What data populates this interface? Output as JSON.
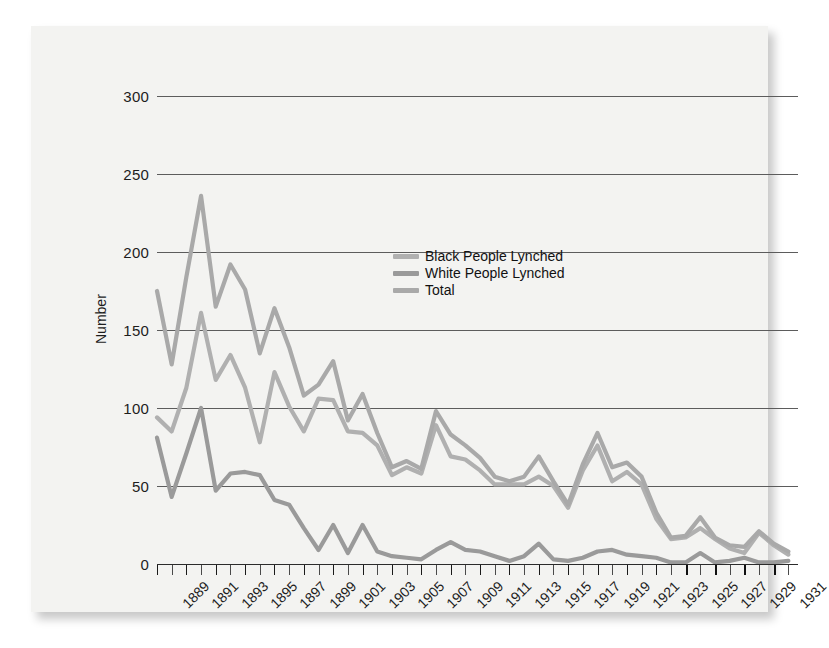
{
  "chart_data": {
    "type": "line",
    "title": "",
    "xlabel": "",
    "ylabel": "Number",
    "ylim": [
      0,
      300
    ],
    "yticks": [
      0,
      50,
      100,
      150,
      200,
      250,
      300
    ],
    "grid": true,
    "legend_position": "inside-upper-right",
    "x": [
      1889,
      1890,
      1891,
      1892,
      1893,
      1894,
      1895,
      1896,
      1897,
      1898,
      1899,
      1900,
      1901,
      1902,
      1903,
      1904,
      1905,
      1906,
      1907,
      1908,
      1909,
      1910,
      1911,
      1912,
      1913,
      1914,
      1915,
      1916,
      1917,
      1918,
      1919,
      1920,
      1921,
      1922,
      1923,
      1924,
      1925,
      1926,
      1927,
      1928,
      1929,
      1930,
      1931,
      1932
    ],
    "xtick_labels": [
      "1889",
      "1891",
      "1893",
      "1895",
      "1897",
      "1899",
      "1901",
      "1903",
      "1905",
      "1907",
      "1909",
      "1911",
      "1913",
      "1915",
      "1917",
      "1919",
      "1921",
      "1923",
      "1925",
      "1927",
      "1929",
      "1931"
    ],
    "series": [
      {
        "name": "Black People Lynched",
        "color": "#b0b0b0",
        "values": [
          94,
          85,
          113,
          161,
          118,
          134,
          113,
          78,
          123,
          101,
          85,
          106,
          105,
          85,
          84,
          76,
          57,
          62,
          58,
          89,
          69,
          67,
          60,
          51,
          51,
          51,
          56,
          50,
          36,
          60,
          76,
          53,
          59,
          51,
          29,
          16,
          17,
          23,
          16,
          10,
          7,
          20,
          12,
          6
        ]
      },
      {
        "name": "White People Lynched",
        "color": "#9a9a9a",
        "values": [
          81,
          43,
          71,
          100,
          47,
          58,
          59,
          57,
          41,
          38,
          23,
          9,
          25,
          7,
          25,
          8,
          5,
          4,
          3,
          9,
          14,
          9,
          8,
          5,
          2,
          5,
          13,
          3,
          2,
          4,
          8,
          9,
          6,
          5,
          4,
          1,
          1,
          7,
          1,
          2,
          4,
          1,
          1,
          2
        ]
      },
      {
        "name": "Total",
        "color": "#a9a9a9",
        "values": [
          175,
          128,
          184,
          236,
          165,
          192,
          176,
          135,
          164,
          139,
          108,
          115,
          130,
          92,
          109,
          84,
          62,
          66,
          61,
          98,
          83,
          76,
          68,
          56,
          53,
          56,
          69,
          53,
          38,
          64,
          84,
          62,
          65,
          56,
          33,
          17,
          18,
          30,
          17,
          12,
          11,
          21,
          13,
          8
        ]
      }
    ]
  },
  "legend": {
    "items": [
      {
        "label": "Black People Lynched"
      },
      {
        "label": "White People Lynched"
      },
      {
        "label": "Total"
      }
    ]
  },
  "axes": {
    "y_title": "Number",
    "y_tick_labels": [
      "300",
      "250",
      "200",
      "150",
      "100",
      "50",
      "0"
    ]
  }
}
